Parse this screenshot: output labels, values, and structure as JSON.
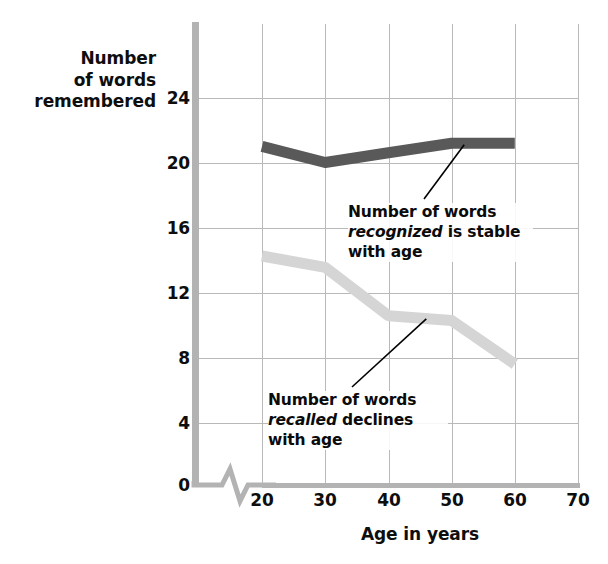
{
  "chart_data": {
    "type": "line",
    "title": "",
    "xlabel": "Age in years",
    "ylabel": "Number of words remembered",
    "ylabel_lines": [
      "Number",
      "of words",
      "remembered"
    ],
    "x": [
      20,
      30,
      40,
      50,
      60
    ],
    "xticks": [
      20,
      30,
      40,
      50,
      60,
      70
    ],
    "yticks": [
      0,
      4,
      8,
      12,
      16,
      20,
      24
    ],
    "xlim": [
      20,
      70
    ],
    "ylim": [
      0,
      26
    ],
    "grid": true,
    "legend": "none",
    "axis_break": true,
    "series": [
      {
        "name": "Number of words recognized",
        "color": "#595959",
        "values": [
          21.0,
          20.0,
          20.6,
          21.2,
          21.2
        ]
      },
      {
        "name": "Number of words recalled",
        "color": "#d5d5d5",
        "values": [
          14.2,
          13.5,
          10.5,
          10.2,
          7.5
        ]
      }
    ],
    "annotations": [
      {
        "id": "recognized",
        "text_before": "Number of words ",
        "emphasis": "recognized",
        "text_after": " is stable with age",
        "line1": "Number of words",
        "line2_em": "recognized",
        "line2_rest": " is stable",
        "line3": "with age",
        "points_to": {
          "age": 52,
          "value": 21.1
        }
      },
      {
        "id": "recalled",
        "text_before": "Number of words ",
        "emphasis": "recalled",
        "text_after": " declines with age",
        "line1": "Number of words",
        "line2_em": "recalled",
        "line2_rest": " declines",
        "line3": "with age",
        "points_to": {
          "age": 46,
          "value": 10.3
        }
      }
    ]
  },
  "axes": {
    "y_title_lines": [
      "Number",
      "of words",
      "remembered"
    ],
    "x_title": "Age in years",
    "ytick_labels": [
      "24",
      "20",
      "16",
      "12",
      "8",
      "4",
      "0"
    ],
    "xtick_labels": [
      "20",
      "30",
      "40",
      "50",
      "60",
      "70"
    ]
  },
  "colors": {
    "recognized_line": "#595959",
    "recalled_line": "#d5d5d5",
    "gridline": "#b9b9b9",
    "axis": "#b3b3b3",
    "text": "#0e0e0e",
    "background": "#ffffff"
  }
}
